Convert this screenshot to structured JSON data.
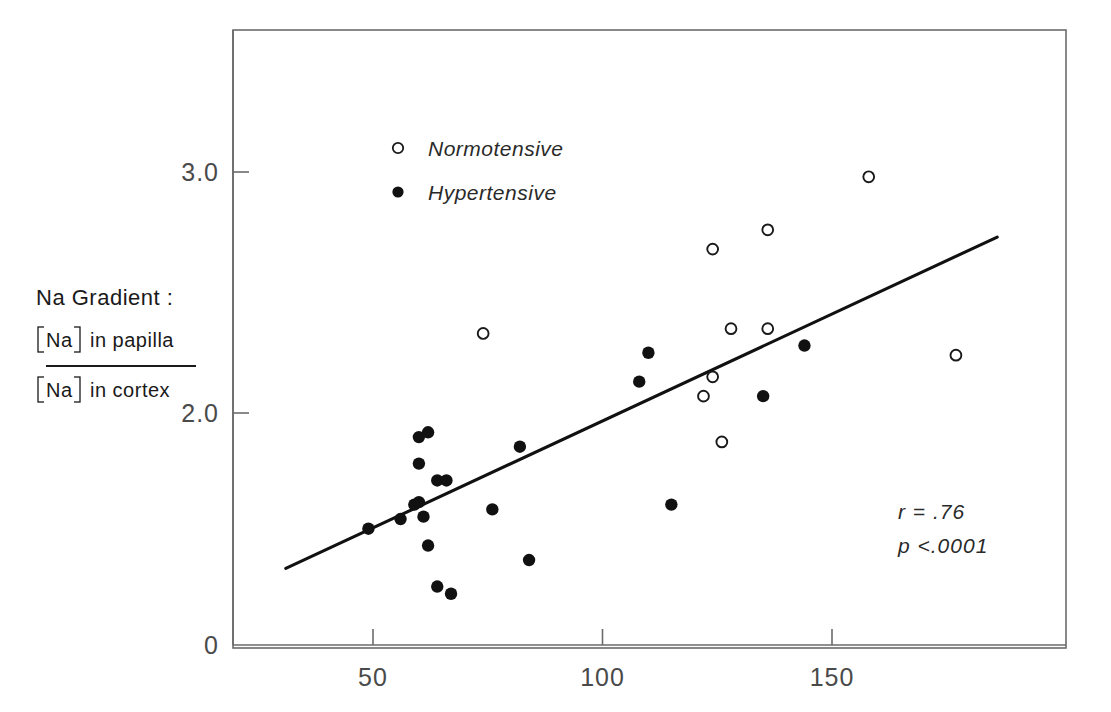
{
  "figure": {
    "background": "#ffffff",
    "ink_color": "#1a1a1a",
    "axis_color": "#6b6b6b"
  },
  "axes": {
    "y_label_line1": "Na Gradient :",
    "y_label_numerator": "in papilla",
    "y_label_denominator": "in cortex",
    "y_label_species": "Na",
    "y_ticks": [
      "3.0",
      "2.0",
      "0"
    ],
    "y_tick_values": [
      3.0,
      2.0,
      0
    ],
    "x_ticks": [
      "50",
      "100",
      "150"
    ],
    "x_tick_values": [
      50,
      100,
      150
    ],
    "x_label": "",
    "frame": "box"
  },
  "legend": {
    "entries": [
      {
        "label": "Normotensive",
        "marker": "open-circle"
      },
      {
        "label": "Hypertensive",
        "marker": "filled-circle"
      }
    ]
  },
  "stats": {
    "correlation": "r = .76",
    "pvalue": "p <.0001"
  },
  "chart_data": {
    "type": "scatter",
    "title": "",
    "xlabel": "",
    "ylabel": "Na Gradient : [Na] in papilla / [Na] in cortex",
    "xlim": [
      20,
      185
    ],
    "ylim": [
      0.9,
      3.4
    ],
    "grid": false,
    "legend_position": "top-left-inside",
    "annotations": [
      "r = .76",
      "p <.0001"
    ],
    "series": [
      {
        "name": "Normotensive",
        "marker": "open-circle",
        "points": [
          [
            74,
            2.33
          ],
          [
            122,
            2.07
          ],
          [
            124,
            2.68
          ],
          [
            124,
            2.15
          ],
          [
            126,
            1.88
          ],
          [
            128,
            2.35
          ],
          [
            136,
            2.76
          ],
          [
            136,
            2.35
          ],
          [
            158,
            2.98
          ],
          [
            177,
            2.24
          ]
        ]
      },
      {
        "name": "Hypertensive",
        "marker": "filled-circle",
        "points": [
          [
            49,
            1.52
          ],
          [
            56,
            1.56
          ],
          [
            59,
            1.62
          ],
          [
            60,
            1.63
          ],
          [
            60,
            1.9
          ],
          [
            60,
            1.79
          ],
          [
            61,
            1.57
          ],
          [
            62,
            1.92
          ],
          [
            62,
            1.45
          ],
          [
            64,
            1.72
          ],
          [
            66,
            1.72
          ],
          [
            64,
            1.28
          ],
          [
            67,
            1.25
          ],
          [
            76,
            1.6
          ],
          [
            82,
            1.86
          ],
          [
            84,
            1.39
          ],
          [
            108,
            2.13
          ],
          [
            110,
            2.25
          ],
          [
            115,
            1.62
          ],
          [
            135,
            2.07
          ],
          [
            144,
            2.28
          ]
        ]
      }
    ],
    "regression_line": {
      "x_start": 31,
      "y_start": 1.355,
      "x_end": 186,
      "y_end": 2.73,
      "slope": 0.00887,
      "intercept": 1.08
    }
  }
}
